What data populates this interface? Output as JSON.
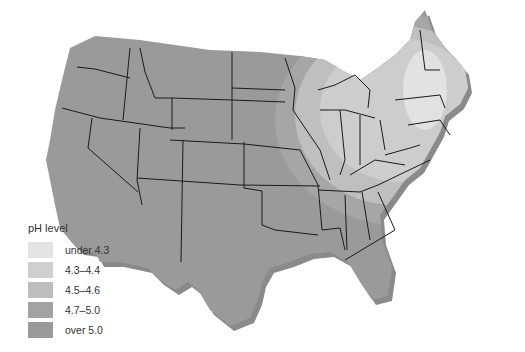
{
  "map": {
    "region": "Contiguous United States",
    "base_color": "#9a9a9a",
    "shadow_color": "#8c8c8c",
    "border_color": "#1a1a1a"
  },
  "legend": {
    "title": "pH level",
    "items": [
      {
        "label": "under 4.3",
        "color": "#e4e4e4"
      },
      {
        "label": "4.3–4.4",
        "color": "#cfcfcf"
      },
      {
        "label": "4.5–4.6",
        "color": "#bdbdbd"
      },
      {
        "label": "4.7–5.0",
        "color": "#a3a3a3"
      },
      {
        "label": "over 5.0",
        "color": "#999999"
      }
    ]
  }
}
